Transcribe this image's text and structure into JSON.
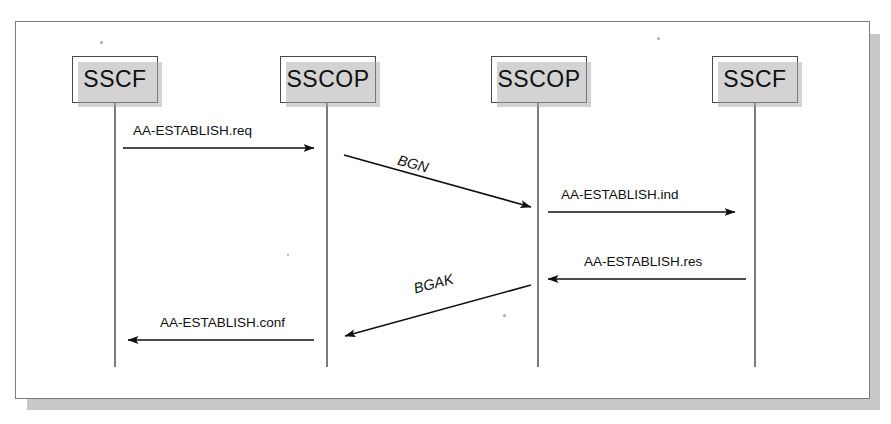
{
  "figure": {
    "type": "sequence-diagram",
    "frame": {
      "x": 15,
      "y": 21,
      "width": 855,
      "height": 378
    }
  },
  "entities": [
    {
      "label": "SSCF",
      "box": {
        "x": 72,
        "y": 56,
        "width": 86,
        "height": 47
      },
      "lifeline_x": 115,
      "lifeline_top": 103,
      "lifeline_bottom": 367
    },
    {
      "label": "SSCOP",
      "box": {
        "x": 280,
        "y": 56,
        "width": 96,
        "height": 47
      },
      "lifeline_x": 327,
      "lifeline_top": 103,
      "lifeline_bottom": 367
    },
    {
      "label": "SSCOP",
      "box": {
        "x": 491,
        "y": 56,
        "width": 96,
        "height": 47
      },
      "lifeline_x": 538,
      "lifeline_top": 103,
      "lifeline_bottom": 367
    },
    {
      "label": "SSCF",
      "box": {
        "x": 712,
        "y": 56,
        "width": 86,
        "height": 47
      },
      "lifeline_x": 755,
      "lifeline_top": 103,
      "lifeline_bottom": 367
    }
  ],
  "messages": [
    {
      "label": "AA-ESTABLISH.req",
      "style": "horizontal",
      "direction": "right",
      "from_entity": 0,
      "to_entity": 1,
      "x1": 123,
      "y1": 148,
      "x2": 314,
      "y2": 148,
      "label_x": 133,
      "label_y": 123
    },
    {
      "label": "BGN",
      "style": "diagonal",
      "direction": "right-down",
      "from_entity": 1,
      "to_entity": 2,
      "x1": 344,
      "y1": 155,
      "x2": 531,
      "y2": 207,
      "label_x": 400,
      "label_y": 152,
      "label_rotation": 15
    },
    {
      "label": "AA-ESTABLISH.ind",
      "style": "horizontal",
      "direction": "right",
      "from_entity": 2,
      "to_entity": 3,
      "x1": 548,
      "y1": 212,
      "x2": 735,
      "y2": 212,
      "label_x": 561,
      "label_y": 187
    },
    {
      "label": "AA-ESTABLISH.res",
      "style": "horizontal",
      "direction": "left",
      "from_entity": 3,
      "to_entity": 2,
      "x1": 746,
      "y1": 279,
      "x2": 548,
      "y2": 279,
      "label_x": 584,
      "label_y": 254
    },
    {
      "label": "BGAK",
      "style": "diagonal",
      "direction": "left-down",
      "from_entity": 2,
      "to_entity": 1,
      "x1": 531,
      "y1": 285,
      "x2": 345,
      "y2": 336,
      "label_x": 412,
      "label_y": 281,
      "label_rotation": -15
    },
    {
      "label": "AA-ESTABLISH.conf",
      "style": "horizontal",
      "direction": "left",
      "from_entity": 1,
      "to_entity": 0,
      "x1": 314,
      "y1": 340,
      "x2": 128,
      "y2": 340,
      "label_x": 160,
      "label_y": 315
    }
  ],
  "colors": {
    "line": "#101010",
    "box_border": "#4a4a4a",
    "box_fill": "#ffffff",
    "shadow": "#a8a8a8",
    "frame_border": "#7d7d7d",
    "page_background": "#ffffff"
  },
  "specks": [
    {
      "x": 100,
      "y": 41,
      "size": 3
    },
    {
      "x": 657,
      "y": 37,
      "size": 3
    },
    {
      "x": 503,
      "y": 314,
      "size": 3
    },
    {
      "x": 287,
      "y": 254,
      "size": 2
    }
  ]
}
